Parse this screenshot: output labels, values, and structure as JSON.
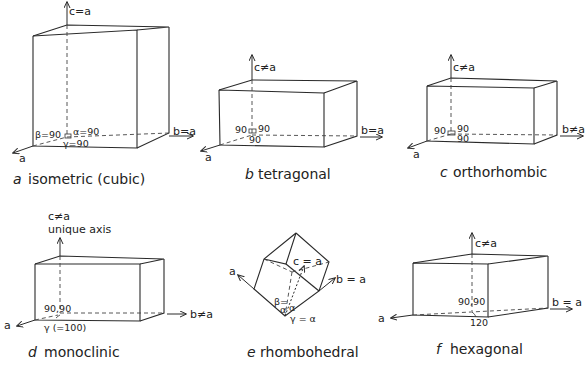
{
  "figure": {
    "panels": [
      {
        "letter": "a",
        "name": "isometric (cubic)",
        "axes": {
          "c": "c=a",
          "b": "b=a",
          "a": "a"
        },
        "angles": {
          "alpha": "α=90",
          "beta": "β=90",
          "gamma": "γ=90"
        }
      },
      {
        "letter": "b",
        "name": "tetragonal",
        "axes": {
          "c": "c≠a",
          "b": "b=a",
          "a": "a"
        },
        "angles": {
          "alpha": "90",
          "beta": "90",
          "gamma": "90"
        }
      },
      {
        "letter": "c",
        "name": "orthorhombic",
        "axes": {
          "c": "c≠a",
          "b": "b≠a",
          "a": "a"
        },
        "angles": {
          "alpha": "90",
          "beta": "90",
          "gamma": "90"
        }
      },
      {
        "letter": "d",
        "name": "monoclinic",
        "axes": {
          "c": "c≠a",
          "c_note": "unique axis",
          "b": "b≠a",
          "a": "a"
        },
        "angles": {
          "pair": "90,90",
          "gamma": "γ (=100)"
        }
      },
      {
        "letter": "e",
        "name": "rhombohedral",
        "axes": {
          "c": "c = a",
          "b": "b = a",
          "a": "a"
        },
        "angles": {
          "beta": "β=",
          "alpha1": "α",
          "alpha2": "α",
          "gamma": "γ = α"
        }
      },
      {
        "letter": "f",
        "name": "hexagonal",
        "axes": {
          "c": "c≠a",
          "b": "b = a",
          "a": "a"
        },
        "angles": {
          "pair": "90,90",
          "gamma": "120"
        }
      }
    ]
  }
}
